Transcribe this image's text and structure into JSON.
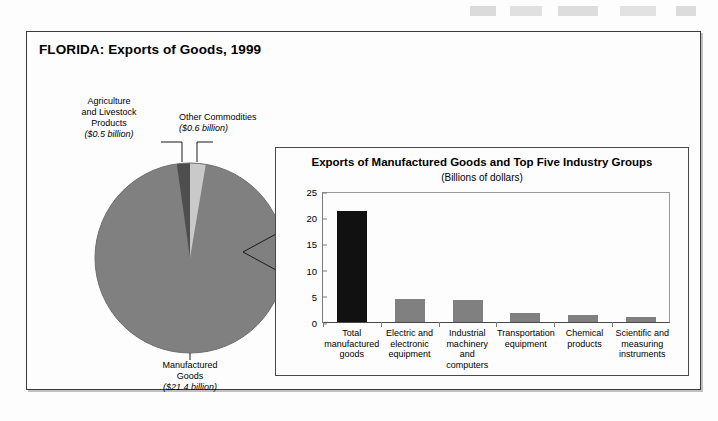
{
  "figure": {
    "title": "FLORIDA: Exports of Goods, 1999"
  },
  "pie_labels": {
    "agriculture": {
      "line1": "Agriculture",
      "line2": "and Livestock",
      "line3": "Products",
      "value": "($0.5 billion)"
    },
    "other": {
      "line1": "Other Commodities",
      "value": "($0.6 billion)"
    },
    "manufactured": {
      "line1": "Manufactured",
      "line2": "Goods",
      "value": "($21.4 billion)"
    }
  },
  "inset": {
    "title": "Exports of Manufactured Goods and Top Five Industry Groups",
    "subtitle": "(Billions of dollars)"
  },
  "chart_data": [
    {
      "type": "pie",
      "title": "FLORIDA: Exports of Goods, 1999",
      "unit": "billions of dollars",
      "labels": [
        "Manufactured Goods",
        "Other Commodities",
        "Agriculture and Livestock Products"
      ],
      "values": [
        21.4,
        0.6,
        0.5
      ],
      "colors": [
        "#808080",
        "#c8c8c8",
        "#4a4a4a"
      ],
      "legend": "labels-with-leader-lines",
      "total": 22.5
    },
    {
      "type": "bar",
      "title": "Exports of Manufactured Goods and Top Five Industry Groups",
      "subtitle": "(Billions of dollars)",
      "categories": [
        "Total manufactured goods",
        "Electric and electronic equipment",
        "Industrial machinery and computers",
        "Transportation equipment",
        "Chemical products",
        "Scientific and measuring instruments"
      ],
      "category_lines": [
        [
          "Total",
          "manufactured",
          "goods"
        ],
        [
          "Electric and",
          "electronic",
          "equipment"
        ],
        [
          "Industrial",
          "machinery and",
          "computers"
        ],
        [
          "Transportation",
          "equipment"
        ],
        [
          "Chemical",
          "products"
        ],
        [
          "Scientific and",
          "measuring",
          "instruments"
        ]
      ],
      "values": [
        21.4,
        4.4,
        4.2,
        1.8,
        1.4,
        1.0
      ],
      "bar_colors": [
        "#111111",
        "#808080",
        "#808080",
        "#808080",
        "#808080",
        "#808080"
      ],
      "xlabel": "",
      "ylabel": "",
      "ylim": [
        0,
        25
      ],
      "yticks": [
        0,
        5,
        10,
        15,
        20,
        25
      ],
      "grid": false,
      "legend": "none"
    }
  ]
}
